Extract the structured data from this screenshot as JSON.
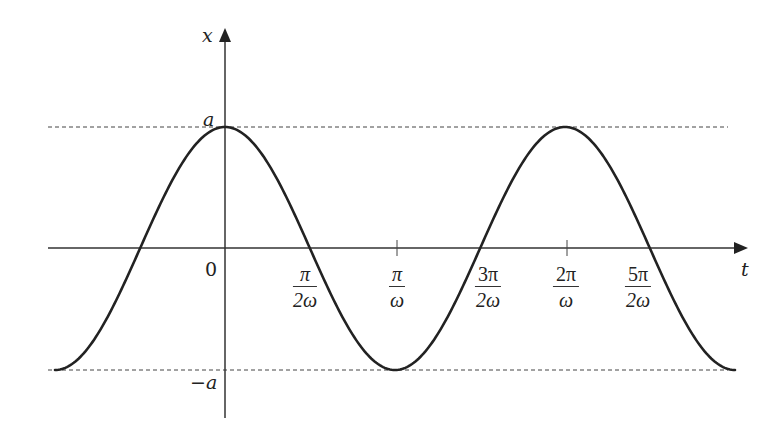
{
  "chart_data": {
    "type": "line",
    "title": "",
    "function": "x(t) = a cos(ωt)",
    "xlabel": "t",
    "ylabel": "x",
    "x_ticks": [
      {
        "label": "0",
        "value": 0
      },
      {
        "label": "π/2ω",
        "num": "π",
        "den": "2ω",
        "value_in_pi_over_omega": 0.5
      },
      {
        "label": "π/ω",
        "num": "π",
        "den": "ω",
        "value_in_pi_over_omega": 1.0
      },
      {
        "label": "3π/2ω",
        "num": "3π",
        "den": "2ω",
        "value_in_pi_over_omega": 1.5
      },
      {
        "label": "2π/ω",
        "num": "2π",
        "den": "ω",
        "value_in_pi_over_omega": 2.0
      },
      {
        "label": "5π/2ω",
        "num": "5π",
        "den": "2ω",
        "value_in_pi_over_omega": 2.5
      }
    ],
    "y_levels": [
      {
        "label": "a",
        "value": 1,
        "style": "dashed"
      },
      {
        "label": "−a",
        "value": -1,
        "style": "dashed"
      }
    ],
    "x_range_in_pi_over_omega": [
      -1.0,
      3.0
    ],
    "y_range": [
      -1,
      1
    ],
    "amplitude_label": "a",
    "series": [
      {
        "name": "x(t)",
        "x_in_pi_over_omega": [
          -1.0,
          -0.5,
          0.0,
          0.5,
          1.0,
          1.5,
          2.0,
          2.5,
          3.0
        ],
        "values": [
          -1,
          0,
          1,
          0,
          -1,
          0,
          1,
          0,
          -1
        ]
      }
    ],
    "grid": false,
    "legend": null
  },
  "labels": {
    "y_axis": "x",
    "x_axis": "t",
    "origin": "0",
    "amp_pos": "a",
    "amp_neg": "−a",
    "ticks": [
      {
        "num": "π",
        "den": "2ω"
      },
      {
        "num": "π",
        "den": "ω"
      },
      {
        "num": "3π",
        "den": "2ω"
      },
      {
        "num": "2π",
        "den": "ω"
      },
      {
        "num": "5π",
        "den": "2ω"
      }
    ]
  },
  "colors": {
    "curve": "#222222",
    "axes": "#333333",
    "dashed": "#444444",
    "background": "#ffffff"
  }
}
